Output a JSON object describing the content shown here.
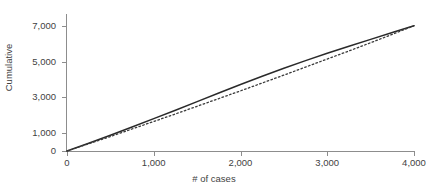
{
  "chart_data": {
    "type": "line",
    "title": "Weibull cumulative fit chart",
    "xlabel": "# of cases",
    "ylabel": "Cumulative",
    "xlim": [
      0,
      4000
    ],
    "ylim": [
      0,
      7600
    ],
    "xticks": [
      0,
      1000,
      2000,
      3000,
      4000
    ],
    "xticklabels": [
      "0",
      "1,000",
      "2,000",
      "3,000",
      "4,000"
    ],
    "yticks": [
      0,
      1000,
      3000,
      5000,
      7000
    ],
    "yticklabels": [
      "0",
      "1,000",
      "3,000",
      "5,000",
      "7,000"
    ],
    "grid": false,
    "legend": "none",
    "series": [
      {
        "name": "Observed cumulative",
        "style": "solid",
        "color": "#2a2a2a",
        "x": [
          0,
          250,
          500,
          750,
          1000,
          1250,
          1500,
          1750,
          2000,
          2250,
          2500,
          2750,
          3000,
          3250,
          3500,
          3750,
          4000
        ],
        "y": [
          0,
          430,
          880,
          1340,
          1810,
          2280,
          2760,
          3240,
          3720,
          4180,
          4620,
          5050,
          5460,
          5850,
          6240,
          6620,
          7000
        ]
      },
      {
        "name": "Fitted cumulative",
        "style": "dotted",
        "color": "#3a3a3a",
        "x": [
          0,
          250,
          500,
          750,
          1000,
          1250,
          1500,
          1750,
          2000,
          2250,
          2500,
          2750,
          3000,
          3250,
          3500,
          3750,
          4000
        ],
        "y": [
          0,
          400,
          810,
          1230,
          1650,
          2070,
          2500,
          2930,
          3360,
          3800,
          4240,
          4690,
          5140,
          5590,
          6050,
          6520,
          7000
        ]
      }
    ]
  }
}
